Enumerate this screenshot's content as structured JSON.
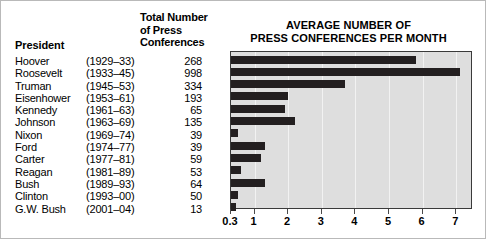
{
  "table": {
    "headers": {
      "president": "President",
      "total": "Total Number of Press Conferences",
      "total_line1": "Total Number",
      "total_line2": "of Press",
      "total_line3": "Conferences"
    },
    "rows": [
      {
        "name": "Hoover",
        "years": "(1929–33)",
        "total": "268"
      },
      {
        "name": "Roosevelt",
        "years": "(1933–45)",
        "total": "998"
      },
      {
        "name": "Truman",
        "years": "(1945–53)",
        "total": "334"
      },
      {
        "name": "Eisenhower",
        "years": "(1953–61)",
        "total": "193"
      },
      {
        "name": "Kennedy",
        "years": "(1961–63)",
        "total": "65"
      },
      {
        "name": "Johnson",
        "years": "(1963–69)",
        "total": "135"
      },
      {
        "name": "Nixon",
        "years": "(1969–74)",
        "total": "39"
      },
      {
        "name": "Ford",
        "years": "(1974–77)",
        "total": "39"
      },
      {
        "name": "Carter",
        "years": "(1977–81)",
        "total": "59"
      },
      {
        "name": "Reagan",
        "years": "(1981–89)",
        "total": "53"
      },
      {
        "name": "Bush",
        "years": "(1989–93)",
        "total": "64"
      },
      {
        "name": "Clinton",
        "years": "(1993–00)",
        "total": "50"
      },
      {
        "name": "G.W. Bush",
        "years": "(2001–04)",
        "total": "13"
      }
    ]
  },
  "chart_data": {
    "type": "bar",
    "orientation": "horizontal",
    "title": "AVERAGE NUMBER OF PRESS CONFERENCES PER MONTH",
    "title_line1": "AVERAGE NUMBER OF",
    "title_line2": "PRESS CONFERENCES PER MONTH",
    "xlabel": "",
    "ylabel": "",
    "categories": [
      "Hoover",
      "Roosevelt",
      "Truman",
      "Eisenhower",
      "Kennedy",
      "Johnson",
      "Nixon",
      "Ford",
      "Carter",
      "Reagan",
      "Bush",
      "Clinton",
      "G.W. Bush"
    ],
    "values": [
      5.8,
      7.1,
      3.7,
      2.0,
      1.9,
      2.2,
      0.5,
      1.3,
      1.2,
      0.6,
      1.3,
      0.5,
      0.3
    ],
    "xlim": [
      0.3,
      7.5
    ],
    "xticks": [
      0.3,
      1,
      2,
      3,
      4,
      5,
      6,
      7
    ],
    "xticklabels": [
      "0.3",
      "1",
      "2",
      "3",
      "4",
      "5",
      "6",
      "7"
    ],
    "grid": true,
    "legend": false,
    "bar_color": "#231f20",
    "plot_background": "#dedede"
  }
}
